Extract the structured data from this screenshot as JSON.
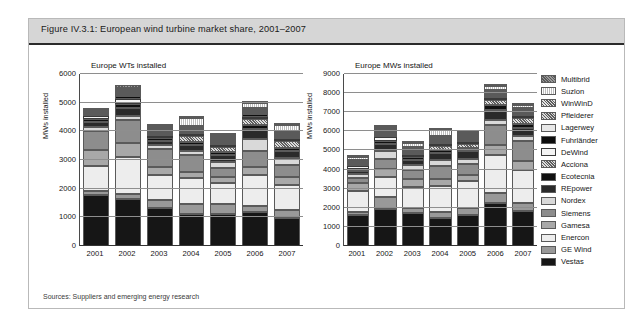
{
  "figure": {
    "title": "Figure IV.3.1: European wind turbine market share, 2001–2007",
    "source": "Sources: Suppliers and emerging energy research"
  },
  "legend": {
    "items": [
      {
        "label": "Multibrid",
        "fill": "#6f6f6f",
        "pattern": "dither-dark"
      },
      {
        "label": "Suzlon",
        "fill": "#ffffff",
        "pattern": "dots-light"
      },
      {
        "label": "WinWinD",
        "fill": "#e3e3e3",
        "pattern": "hatch"
      },
      {
        "label": "Pfleiderer",
        "fill": "#d8d8d8",
        "pattern": "hatch"
      },
      {
        "label": "Lagerwey",
        "fill": "#e8e8e8",
        "pattern": "solid"
      },
      {
        "label": "Fuhrländer",
        "fill": "#0d0d0d",
        "pattern": "solid"
      },
      {
        "label": "DeWind",
        "fill": "#f4f4f4",
        "pattern": "outline"
      },
      {
        "label": "Acciona",
        "fill": "#dcdcdc",
        "pattern": "hatch"
      },
      {
        "label": "Ecotecnia",
        "fill": "#101010",
        "pattern": "solid"
      },
      {
        "label": "REpower",
        "fill": "#2a2a2a",
        "pattern": "solid"
      },
      {
        "label": "Nordex",
        "fill": "#d9d9d9",
        "pattern": "solid"
      },
      {
        "label": "Siemens",
        "fill": "#8d8d8d",
        "pattern": "solid"
      },
      {
        "label": "Gamesa",
        "fill": "#a8a8a8",
        "pattern": "solid"
      },
      {
        "label": "Enercon",
        "fill": "#ededed",
        "pattern": "solid"
      },
      {
        "label": "GE Wind",
        "fill": "#999999",
        "pattern": "solid"
      },
      {
        "label": "Vestas",
        "fill": "#161616",
        "pattern": "solid"
      }
    ]
  },
  "chart_data": [
    {
      "id": "wts",
      "type": "bar",
      "stacked": true,
      "title": "Europe WTs installed",
      "xlabel": "",
      "ylabel": "MWs installed",
      "ylim": [
        0,
        6000
      ],
      "yticks": [
        0,
        1000,
        2000,
        3000,
        4000,
        5000,
        6000
      ],
      "grid": true,
      "categories": [
        "2001",
        "2002",
        "2003",
        "2004",
        "2005",
        "2006",
        "2007"
      ],
      "totals": [
        4680,
        5510,
        3980,
        4330,
        3740,
        4850,
        4060
      ],
      "series": [
        {
          "name": "Vestas",
          "values": [
            1790,
            1640,
            1310,
            1130,
            1120,
            1190,
            980
          ]
        },
        {
          "name": "GE Wind",
          "values": [
            130,
            170,
            300,
            330,
            350,
            220,
            260
          ]
        },
        {
          "name": "Enercon",
          "values": [
            860,
            1290,
            860,
            900,
            740,
            1080,
            900
          ]
        },
        {
          "name": "Gamesa",
          "values": [
            570,
            500,
            300,
            210,
            190,
            260,
            260
          ]
        },
        {
          "name": "Siemens",
          "values": [
            680,
            800,
            600,
            600,
            330,
            560,
            440
          ]
        },
        {
          "name": "Nordex",
          "values": [
            130,
            150,
            150,
            160,
            200,
            440,
            220
          ]
        },
        {
          "name": "REpower",
          "values": [
            170,
            270,
            150,
            200,
            250,
            330,
            250
          ]
        },
        {
          "name": "Ecotecnia",
          "values": [
            90,
            150,
            90,
            110,
            110,
            150,
            110
          ]
        },
        {
          "name": "Acciona",
          "values": [
            0,
            0,
            0,
            190,
            150,
            190,
            230
          ]
        },
        {
          "name": "DeWind",
          "values": [
            110,
            170,
            80,
            60,
            40,
            40,
            40
          ]
        },
        {
          "name": "Fuhrländer",
          "values": [
            60,
            90,
            60,
            80,
            80,
            110,
            90
          ]
        },
        {
          "name": "Lagerwey",
          "values": [
            40,
            50,
            30,
            20,
            20,
            20,
            20
          ]
        },
        {
          "name": "Pfleiderer",
          "values": [
            20,
            50,
            20,
            20,
            20,
            20,
            20
          ]
        },
        {
          "name": "WinWinD",
          "values": [
            0,
            20,
            10,
            20,
            30,
            40,
            40
          ]
        },
        {
          "name": "Suzlon",
          "values": [
            0,
            50,
            10,
            280,
            80,
            180,
            200
          ]
        },
        {
          "name": "Multibrid",
          "values": [
            30,
            110,
            10,
            20,
            30,
            20,
            40
          ]
        }
      ]
    },
    {
      "id": "mws",
      "type": "bar",
      "stacked": true,
      "title": "Europe MWs installed",
      "xlabel": "",
      "ylabel": "MWs installed",
      "ylim": [
        0,
        9000
      ],
      "yticks": [
        0,
        1000,
        2000,
        3000,
        4000,
        5000,
        6000,
        7000,
        8000,
        9000
      ],
      "grid": true,
      "categories": [
        "2001",
        "2002",
        "2003",
        "2004",
        "2005",
        "2006",
        "2007"
      ],
      "totals": [
        4530,
        6150,
        5180,
        5830,
        5790,
        8130,
        7130
      ],
      "series": [
        {
          "name": "Vestas",
          "values": [
            1600,
            1940,
            1740,
            1470,
            1640,
            2270,
            1850
          ]
        },
        {
          "name": "GE Wind",
          "values": [
            170,
            620,
            230,
            300,
            340,
            530,
            410
          ]
        },
        {
          "name": "Enercon",
          "values": [
            1090,
            1030,
            1130,
            1360,
            1440,
            1970,
            1700
          ]
        },
        {
          "name": "Gamesa",
          "values": [
            420,
            440,
            390,
            400,
            300,
            520,
            480
          ]
        },
        {
          "name": "Siemens",
          "values": [
            290,
            530,
            490,
            670,
            590,
            1020,
            1070
          ]
        },
        {
          "name": "Nordex",
          "values": [
            180,
            430,
            260,
            310,
            230,
            290,
            250
          ]
        },
        {
          "name": "REpower",
          "values": [
            180,
            330,
            280,
            370,
            430,
            540,
            430
          ]
        },
        {
          "name": "Ecotecnia",
          "values": [
            100,
            170,
            120,
            160,
            180,
            220,
            190
          ]
        },
        {
          "name": "Acciona",
          "values": [
            0,
            0,
            0,
            200,
            180,
            260,
            310
          ]
        },
        {
          "name": "DeWind",
          "values": [
            130,
            210,
            100,
            70,
            50,
            50,
            40
          ]
        },
        {
          "name": "Fuhrländer",
          "values": [
            70,
            110,
            80,
            110,
            120,
            150,
            120
          ]
        },
        {
          "name": "Lagerwey",
          "values": [
            40,
            50,
            30,
            20,
            20,
            20,
            20
          ]
        },
        {
          "name": "Pfleiderer",
          "values": [
            30,
            60,
            30,
            20,
            20,
            20,
            20
          ]
        },
        {
          "name": "WinWinD",
          "values": [
            0,
            30,
            20,
            40,
            60,
            70,
            60
          ]
        },
        {
          "name": "Suzlon",
          "values": [
            170,
            80,
            230,
            290,
            120,
            170,
            130
          ]
        },
        {
          "name": "Multibrid",
          "values": [
            60,
            120,
            50,
            40,
            70,
            30,
            50
          ]
        }
      ]
    }
  ]
}
